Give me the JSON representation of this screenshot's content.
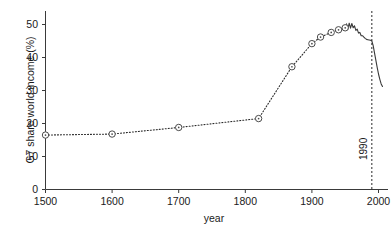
{
  "chart_data": {
    "type": "line",
    "title": "",
    "xlabel": "year",
    "ylabel": "G7 share world income (%)",
    "xlim": [
      1500,
      2010
    ],
    "ylim": [
      0,
      54
    ],
    "xticks": [
      1500,
      1600,
      1700,
      1800,
      1900,
      2000
    ],
    "xtick_labels": [
      "1500",
      "1600",
      "1700",
      "1800",
      "1900",
      "2000"
    ],
    "yticks": [
      0,
      10,
      20,
      30,
      40,
      50
    ],
    "ytick_labels": [
      "0",
      "10",
      "20",
      "30",
      "40",
      "50"
    ],
    "grid": false,
    "legend": "none",
    "series": [
      {
        "name": "G7 share world income (markers, dotted)",
        "style": "dotted-with-markers",
        "x": [
          1500,
          1600,
          1700,
          1820,
          1870,
          1900,
          1913,
          1929,
          1940,
          1950
        ],
        "values": [
          16.5,
          16.8,
          18.8,
          21.5,
          37.2,
          44.2,
          46.2,
          47.6,
          48.4,
          49.0
        ]
      },
      {
        "name": "G7 share world income (annual, solid)",
        "style": "solid",
        "x": [
          1950,
          1952,
          1954,
          1956,
          1958,
          1960,
          1962,
          1964,
          1966,
          1968,
          1970,
          1972,
          1974,
          1976,
          1978,
          1980,
          1982,
          1984,
          1986,
          1988,
          1990,
          1992,
          1994,
          1996,
          1998,
          2000,
          2002,
          2004,
          2006
        ],
        "values": [
          49.0,
          50.2,
          48.6,
          50.4,
          48.9,
          50.3,
          49.0,
          49.6,
          48.2,
          48.6,
          47.4,
          47.6,
          46.6,
          46.6,
          46.2,
          45.8,
          45.5,
          45.4,
          45.3,
          45.2,
          45.0,
          43.6,
          41.4,
          39.2,
          37.0,
          35.0,
          33.4,
          32.0,
          31.2
        ]
      }
    ],
    "annotations": [
      {
        "name": "1990-marker",
        "label": "1990",
        "x": 1990,
        "orientation": "vertical",
        "line_style": "dashed"
      }
    ]
  }
}
